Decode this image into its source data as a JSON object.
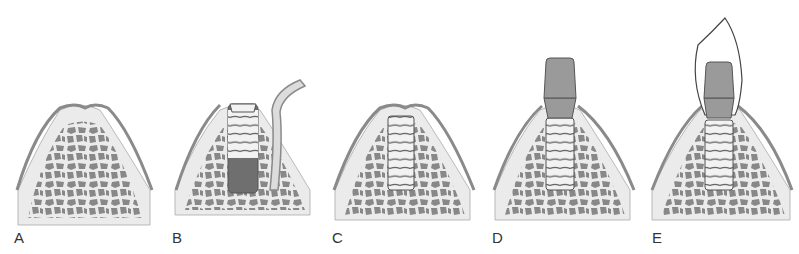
{
  "figure": {
    "colors": {
      "gingiva_outer": "#8a8a8a",
      "gingiva_fill": "#dcdcdc",
      "cortical_bone": "#ebebeb",
      "trabecular_bone": "#888888",
      "implant_light": "#f2f2f2",
      "implant_dark": "#6f6f6f",
      "abutment": "#9a9a9a",
      "crown": "#ffffff"
    },
    "panels": [
      {
        "label": "A",
        "stage": "edentulous ridge"
      },
      {
        "label": "B",
        "stage": "implant placement with flap reflected"
      },
      {
        "label": "C",
        "stage": "submerged implant healing"
      },
      {
        "label": "D",
        "stage": "abutment connected"
      },
      {
        "label": "E",
        "stage": "crown restoration"
      }
    ]
  }
}
